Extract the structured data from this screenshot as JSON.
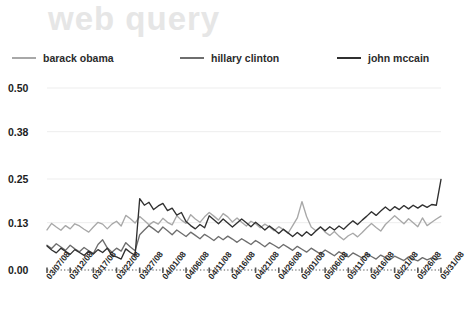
{
  "title": "web query",
  "colors": {
    "obama": "#a8a8a8",
    "clinton": "#6e6e6e",
    "mccain": "#303030",
    "title": "#e6e6e6",
    "axis": "#555555",
    "grid": "#ededed",
    "text": "#1d1d1d"
  },
  "legend": {
    "position": "top",
    "items": [
      {
        "label": "barack obama",
        "color": "#a8a8a8"
      },
      {
        "label": "hillary clinton",
        "color": "#6e6e6e"
      },
      {
        "label": "john mccain",
        "color": "#303030"
      }
    ]
  },
  "chart_data": {
    "type": "line",
    "title": "web query",
    "xlabel": "",
    "ylabel": "",
    "ylim": [
      0.0,
      0.5
    ],
    "yticks": [
      0.0,
      0.13,
      0.25,
      0.38,
      0.5
    ],
    "ytick_labels": [
      "0.00",
      "0.13",
      "0.25",
      "0.38",
      "0.50"
    ],
    "grid": true,
    "legend_position": "top",
    "xtick_labels": [
      "03/07/08",
      "03/12/08",
      "03/17/08",
      "03/22/08",
      "03/27/08",
      "04/01/08",
      "04/06/08",
      "04/11/08",
      "04/16/08",
      "04/21/08",
      "04/26/08",
      "05/01/08",
      "05/06/08",
      "05/11/08",
      "05/16/08",
      "05/21/08",
      "05/26/08",
      "05/31/08"
    ],
    "x": [
      "03/07/08",
      "03/08/08",
      "03/09/08",
      "03/10/08",
      "03/11/08",
      "03/12/08",
      "03/13/08",
      "03/14/08",
      "03/15/08",
      "03/16/08",
      "03/17/08",
      "03/18/08",
      "03/19/08",
      "03/20/08",
      "03/21/08",
      "03/22/08",
      "03/23/08",
      "03/24/08",
      "03/25/08",
      "03/26/08",
      "03/27/08",
      "03/28/08",
      "03/29/08",
      "03/30/08",
      "03/31/08",
      "04/01/08",
      "04/02/08",
      "04/03/08",
      "04/04/08",
      "04/05/08",
      "04/06/08",
      "04/07/08",
      "04/08/08",
      "04/09/08",
      "04/10/08",
      "04/11/08",
      "04/12/08",
      "04/13/08",
      "04/14/08",
      "04/15/08",
      "04/16/08",
      "04/17/08",
      "04/18/08",
      "04/19/08",
      "04/20/08",
      "04/21/08",
      "04/22/08",
      "04/23/08",
      "04/24/08",
      "04/25/08",
      "04/26/08",
      "04/27/08",
      "04/28/08",
      "04/29/08",
      "04/30/08",
      "05/01/08",
      "05/02/08",
      "05/03/08",
      "05/04/08",
      "05/05/08",
      "05/06/08",
      "05/07/08",
      "05/08/08",
      "05/09/08",
      "05/10/08",
      "05/11/08",
      "05/12/08",
      "05/13/08",
      "05/14/08",
      "05/15/08",
      "05/16/08",
      "05/17/08",
      "05/18/08",
      "05/19/08",
      "05/20/08",
      "05/21/08",
      "05/22/08",
      "05/23/08",
      "05/24/08",
      "05/25/08",
      "05/26/08",
      "05/27/08",
      "05/28/08",
      "05/29/08",
      "05/30/08",
      "05/31/08"
    ],
    "series": [
      {
        "name": "barack obama",
        "color": "#a8a8a8",
        "values": [
          0.11,
          0.128,
          0.118,
          0.109,
          0.122,
          0.113,
          0.127,
          0.121,
          0.112,
          0.104,
          0.118,
          0.131,
          0.126,
          0.113,
          0.126,
          0.134,
          0.121,
          0.15,
          0.141,
          0.129,
          0.147,
          0.136,
          0.124,
          0.133,
          0.126,
          0.142,
          0.131,
          0.124,
          0.149,
          0.137,
          0.128,
          0.152,
          0.14,
          0.131,
          0.146,
          0.158,
          0.148,
          0.137,
          0.155,
          0.146,
          0.132,
          0.143,
          0.131,
          0.121,
          0.134,
          0.127,
          0.116,
          0.126,
          0.118,
          0.108,
          0.119,
          0.111,
          0.101,
          0.122,
          0.143,
          0.188,
          0.147,
          0.118,
          0.108,
          0.119,
          0.104,
          0.095,
          0.106,
          0.093,
          0.083,
          0.094,
          0.101,
          0.091,
          0.103,
          0.116,
          0.128,
          0.117,
          0.107,
          0.125,
          0.137,
          0.149,
          0.138,
          0.127,
          0.141,
          0.13,
          0.119,
          0.143,
          0.122,
          0.131,
          0.14,
          0.148
        ]
      },
      {
        "name": "hillary clinton",
        "color": "#6e6e6e",
        "values": [
          0.068,
          0.059,
          0.072,
          0.063,
          0.054,
          0.068,
          0.058,
          0.05,
          0.062,
          0.053,
          0.045,
          0.07,
          0.083,
          0.061,
          0.049,
          0.06,
          0.052,
          0.075,
          0.063,
          0.053,
          0.097,
          0.11,
          0.122,
          0.113,
          0.103,
          0.118,
          0.108,
          0.097,
          0.11,
          0.101,
          0.092,
          0.104,
          0.095,
          0.086,
          0.098,
          0.09,
          0.081,
          0.092,
          0.083,
          0.093,
          0.085,
          0.076,
          0.086,
          0.078,
          0.07,
          0.081,
          0.073,
          0.064,
          0.075,
          0.068,
          0.06,
          0.07,
          0.062,
          0.054,
          0.065,
          0.057,
          0.049,
          0.06,
          0.052,
          0.044,
          0.055,
          0.047,
          0.039,
          0.05,
          0.043,
          0.036,
          0.047,
          0.04,
          0.033,
          0.044,
          0.037,
          0.03,
          0.041,
          0.034,
          0.028,
          0.038,
          0.032,
          0.026,
          0.036,
          0.03,
          0.025,
          0.034,
          0.028,
          0.033,
          0.03,
          0.032
        ]
      },
      {
        "name": "john mccain",
        "color": "#303030",
        "values": [
          0.066,
          0.055,
          0.047,
          0.06,
          0.051,
          0.043,
          0.056,
          0.048,
          0.04,
          0.052,
          0.044,
          0.056,
          0.048,
          0.06,
          0.04,
          0.036,
          0.03,
          0.058,
          0.048,
          0.04,
          0.196,
          0.178,
          0.186,
          0.166,
          0.176,
          0.183,
          0.163,
          0.17,
          0.151,
          0.158,
          0.133,
          0.122,
          0.113,
          0.125,
          0.116,
          0.149,
          0.138,
          0.127,
          0.14,
          0.129,
          0.118,
          0.129,
          0.14,
          0.13,
          0.119,
          0.131,
          0.121,
          0.11,
          0.121,
          0.111,
          0.1,
          0.112,
          0.102,
          0.092,
          0.103,
          0.093,
          0.105,
          0.095,
          0.107,
          0.118,
          0.108,
          0.119,
          0.11,
          0.121,
          0.112,
          0.124,
          0.135,
          0.125,
          0.137,
          0.148,
          0.16,
          0.15,
          0.162,
          0.173,
          0.163,
          0.174,
          0.166,
          0.177,
          0.168,
          0.178,
          0.17,
          0.179,
          0.172,
          0.18,
          0.178,
          0.249
        ]
      }
    ]
  }
}
